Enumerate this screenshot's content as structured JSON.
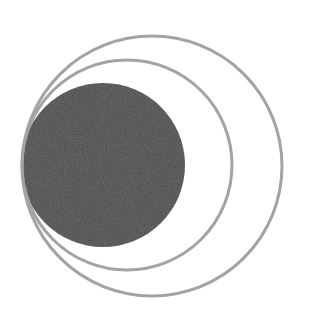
{
  "diagram": {
    "background": "#ffffff",
    "tangent_point": {
      "x": 22,
      "y": 165
    },
    "shapes": [
      {
        "id": "outer-ring",
        "type": "circle-outline",
        "cx": 152,
        "cy": 166,
        "r": 130,
        "stroke": "#a3a3a3",
        "stroke_width": 3
      },
      {
        "id": "inner-ring",
        "type": "circle-outline",
        "cx": 127,
        "cy": 165,
        "r": 105,
        "stroke": "#a3a3a3",
        "stroke_width": 3
      },
      {
        "id": "filled-disk",
        "type": "circle-filled",
        "cx": 103,
        "cy": 165,
        "r": 82,
        "fill": "#4b4b4b"
      }
    ]
  }
}
